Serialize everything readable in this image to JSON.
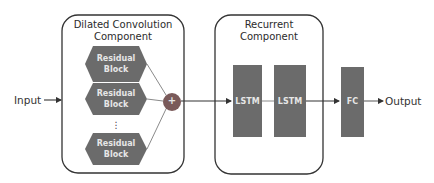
{
  "diagram": {
    "input_label": "Input",
    "output_label": "Output",
    "dilated_component": {
      "title_line1": "Dilated Convolution",
      "title_line2": "Component",
      "blocks": [
        {
          "line1": "Residual",
          "line2": "Block"
        },
        {
          "line1": "Residual",
          "line2": "Block"
        },
        {
          "line1": "Residual",
          "line2": "Block"
        }
      ],
      "ellipsis": "⋮",
      "sum_symbol": "+"
    },
    "recurrent_component": {
      "title_line1": "Recurrent",
      "title_line2": "Component",
      "layers": [
        {
          "label": "LSTM"
        },
        {
          "label": "LSTM"
        }
      ]
    },
    "fc_layer": {
      "label": "FC"
    },
    "colors": {
      "block_fill": "#6b6b6b",
      "block_text": "#e6e6e6",
      "sum_fill": "#7a5a5a",
      "border": "#333333",
      "connector": "#8a8a8a",
      "arrow": "#333333"
    }
  }
}
